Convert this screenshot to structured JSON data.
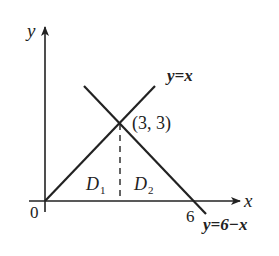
{
  "diagram": {
    "axes": {
      "x_label": "x",
      "y_label": "y",
      "origin_label": "0",
      "x_tick_label": "6"
    },
    "lines": [
      {
        "name": "y=x",
        "label": "y=x"
      },
      {
        "name": "y=6-x",
        "label": "y=6−x"
      }
    ],
    "intersection": {
      "label": "(3, 3)",
      "x": 3,
      "y": 3
    },
    "regions": {
      "D1": {
        "letter": "D",
        "subscript": "1"
      },
      "D2": {
        "letter": "D",
        "subscript": "2"
      }
    },
    "colors": {
      "stroke": "#222222",
      "background": "#ffffff"
    }
  }
}
